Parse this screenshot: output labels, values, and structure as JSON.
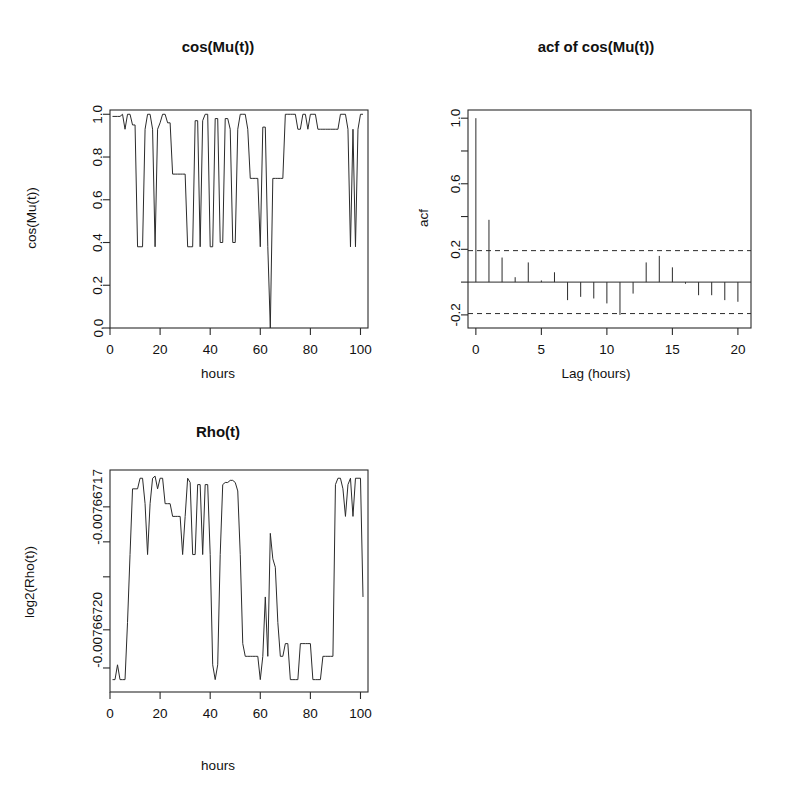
{
  "figure": {
    "background_color": "#ffffff",
    "ink_color": "#2b2b2b",
    "layout": "2x2 grid, bottom-right panel empty",
    "width": 791,
    "height": 804
  },
  "chart_data": [
    {
      "id": "cos-mu-t",
      "type": "line",
      "title": "cos(Mu(t))",
      "xlabel": "hours",
      "ylabel": "cos(Mu(t))",
      "xlim": [
        0,
        103
      ],
      "ylim": [
        0.0,
        1.02
      ],
      "grid": false,
      "legend": null,
      "xticks": [
        0,
        20,
        40,
        60,
        80,
        100
      ],
      "xticklabels": [
        "0",
        "20",
        "40",
        "60",
        "80",
        "100"
      ],
      "yticks": [
        0.0,
        0.2,
        0.4,
        0.6,
        0.8,
        1.0
      ],
      "yticklabels": [
        "0.0",
        "0.2",
        "0.4",
        "0.6",
        "0.8",
        "1.0"
      ],
      "x": [
        1,
        2,
        3,
        4,
        5,
        6,
        7,
        8,
        9,
        10,
        11,
        12,
        13,
        14,
        15,
        16,
        17,
        18,
        19,
        20,
        21,
        22,
        23,
        24,
        25,
        26,
        27,
        28,
        29,
        30,
        31,
        32,
        33,
        34,
        35,
        36,
        37,
        38,
        39,
        40,
        41,
        42,
        43,
        44,
        45,
        46,
        47,
        48,
        49,
        50,
        51,
        52,
        53,
        54,
        55,
        56,
        57,
        58,
        59,
        60,
        61,
        62,
        63,
        64,
        65,
        66,
        67,
        68,
        69,
        70,
        71,
        72,
        73,
        74,
        75,
        76,
        77,
        78,
        79,
        80,
        81,
        82,
        83,
        84,
        85,
        86,
        87,
        88,
        89,
        90,
        91,
        92,
        93,
        94,
        95,
        96,
        97,
        98,
        99,
        100,
        101
      ],
      "values": [
        0.99,
        0.99,
        0.99,
        0.99,
        1.0,
        0.93,
        1.0,
        1.0,
        0.95,
        0.95,
        0.38,
        0.38,
        0.38,
        0.93,
        1.0,
        1.0,
        0.93,
        0.38,
        0.93,
        0.96,
        1.0,
        1.0,
        0.96,
        0.96,
        0.72,
        0.72,
        0.72,
        0.72,
        0.72,
        0.72,
        0.38,
        0.38,
        0.38,
        0.97,
        0.97,
        0.38,
        0.97,
        1.0,
        1.0,
        0.38,
        0.38,
        0.98,
        0.98,
        0.4,
        0.4,
        0.98,
        0.98,
        0.93,
        0.4,
        0.4,
        0.93,
        1.0,
        1.0,
        1.0,
        0.93,
        0.7,
        0.7,
        0.7,
        0.7,
        0.38,
        0.94,
        0.94,
        0.38,
        0.0,
        0.7,
        0.7,
        0.7,
        0.7,
        0.7,
        1.0,
        1.0,
        1.0,
        1.0,
        1.0,
        0.93,
        0.93,
        1.0,
        1.0,
        0.93,
        1.0,
        1.0,
        1.0,
        0.93,
        0.93,
        0.93,
        0.93,
        0.93,
        0.93,
        0.93,
        0.93,
        0.93,
        1.0,
        1.0,
        1.0,
        0.93,
        0.38,
        0.93,
        0.38,
        0.93,
        1.0,
        1.0
      ]
    },
    {
      "id": "acf-cos-mu-t",
      "type": "bar",
      "title": "acf of cos(Mu(t))",
      "xlabel": "Lag (hours)",
      "ylabel": "acf",
      "xlim": [
        -0.6,
        21
      ],
      "ylim": [
        -0.28,
        1.05
      ],
      "grid": false,
      "legend": null,
      "xticks": [
        0,
        5,
        10,
        15,
        20
      ],
      "xticklabels": [
        "0",
        "5",
        "10",
        "15",
        "20"
      ],
      "yticks": [
        -0.2,
        0.0,
        0.2,
        0.4,
        0.6,
        0.8,
        1.0
      ],
      "yticklabels": [
        "-0.2",
        "",
        "0.2",
        "",
        "0.6",
        "",
        "1.0"
      ],
      "confidence_bands": [
        0.192,
        -0.192
      ],
      "categories": [
        0,
        1,
        2,
        3,
        4,
        5,
        6,
        7,
        8,
        9,
        10,
        11,
        12,
        13,
        14,
        15,
        16,
        17,
        18,
        19,
        20
      ],
      "values": [
        1.0,
        0.38,
        0.15,
        0.03,
        0.12,
        0.01,
        0.06,
        -0.11,
        -0.09,
        -0.1,
        -0.13,
        -0.2,
        -0.07,
        0.12,
        0.16,
        0.09,
        -0.01,
        -0.08,
        -0.08,
        -0.11,
        -0.12
      ]
    },
    {
      "id": "rho-t",
      "type": "line",
      "title": "Rho(t)",
      "xlabel": "hours",
      "ylabel": "log2(Rho(t))",
      "xlim": [
        0,
        103
      ],
      "ylim": [
        -0.007667207,
        -0.007667155
      ],
      "grid": false,
      "legend": null,
      "xticks": [
        0,
        20,
        40,
        60,
        80,
        100
      ],
      "xticklabels": [
        "0",
        "20",
        "40",
        "60",
        "80",
        "100"
      ],
      "yticks": [
        -0.00766717,
        -0.00766718,
        -0.00766719,
        -0.0076672,
        -0.007667205
      ],
      "yticklabels": [
        "-0.00766717",
        "",
        "",
        "-0.00766720",
        ""
      ],
      "x": [
        1,
        2,
        3,
        4,
        5,
        6,
        7,
        8,
        9,
        10,
        11,
        12,
        13,
        14,
        15,
        16,
        17,
        18,
        19,
        20,
        21,
        22,
        23,
        24,
        25,
        26,
        27,
        28,
        29,
        30,
        31,
        32,
        33,
        34,
        35,
        36,
        37,
        38,
        39,
        40,
        41,
        42,
        43,
        44,
        45,
        46,
        47,
        48,
        49,
        50,
        51,
        52,
        53,
        54,
        55,
        56,
        57,
        58,
        59,
        60,
        61,
        62,
        63,
        64,
        65,
        66,
        67,
        68,
        69,
        70,
        71,
        72,
        73,
        74,
        75,
        76,
        77,
        78,
        79,
        80,
        81,
        82,
        83,
        84,
        85,
        86,
        87,
        88,
        89,
        90,
        91,
        92,
        93,
        94,
        95,
        96,
        97,
        98,
        99,
        100,
        101
      ],
      "values": [
        0.03,
        0.03,
        0.1,
        0.03,
        0.03,
        0.03,
        0.3,
        0.62,
        0.93,
        0.93,
        0.93,
        0.98,
        0.98,
        0.86,
        0.62,
        0.86,
        0.98,
        0.99,
        0.93,
        0.98,
        0.98,
        0.86,
        0.86,
        0.86,
        0.8,
        0.8,
        0.8,
        0.8,
        0.62,
        0.8,
        0.98,
        0.96,
        0.62,
        0.62,
        0.95,
        0.95,
        0.62,
        0.95,
        0.95,
        0.62,
        0.1,
        0.03,
        0.1,
        0.62,
        0.95,
        0.96,
        0.96,
        0.97,
        0.97,
        0.96,
        0.92,
        0.62,
        0.2,
        0.14,
        0.14,
        0.14,
        0.14,
        0.14,
        0.14,
        0.03,
        0.14,
        0.42,
        0.14,
        0.72,
        0.6,
        0.56,
        0.3,
        0.14,
        0.14,
        0.2,
        0.2,
        0.03,
        0.03,
        0.03,
        0.03,
        0.2,
        0.2,
        0.2,
        0.2,
        0.2,
        0.03,
        0.03,
        0.03,
        0.03,
        0.14,
        0.14,
        0.14,
        0.14,
        0.14,
        0.95,
        0.98,
        0.98,
        0.93,
        0.8,
        0.95,
        0.98,
        0.8,
        0.98,
        0.98,
        0.98,
        0.42
      ]
    }
  ]
}
